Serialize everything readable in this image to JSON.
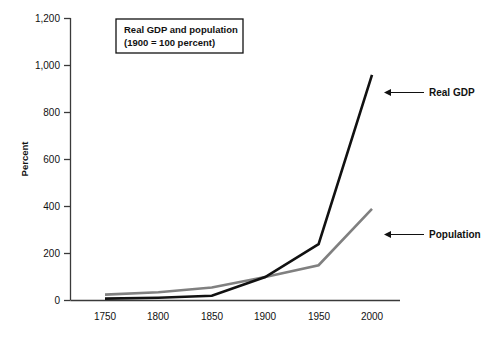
{
  "chart_data": {
    "type": "line",
    "title": "",
    "subtitle": "",
    "xlabel": "",
    "ylabel": "Percent",
    "x": [
      1750,
      1800,
      1850,
      1900,
      1950,
      2000
    ],
    "categories": [
      "1750",
      "1800",
      "1850",
      "1900",
      "1950",
      "2000"
    ],
    "xlim": [
      1725,
      2025
    ],
    "ylim": [
      0,
      1200
    ],
    "ytick_labels": [
      "0",
      "200",
      "400",
      "600",
      "800",
      "1,000",
      "1,200"
    ],
    "ytick_values": [
      0,
      200,
      400,
      600,
      800,
      1000,
      1200
    ],
    "grid": false,
    "legend_position": "none",
    "series": [
      {
        "name": "Real GDP",
        "color": "#111111",
        "width": 2.6,
        "values": [
          8,
          12,
          20,
          100,
          240,
          960
        ]
      },
      {
        "name": "Population",
        "color": "#808080",
        "width": 2.6,
        "values": [
          25,
          35,
          55,
          100,
          150,
          390
        ]
      }
    ],
    "annotations": [
      {
        "label": "Real GDP",
        "target_series": "Real GDP",
        "arrow": "left"
      },
      {
        "label": "Population",
        "target_series": "Population",
        "arrow": "left"
      }
    ],
    "legend_box": {
      "line1": "Real GDP and population",
      "line2": "(1900 = 100 percent)"
    }
  },
  "colors": {
    "real_gdp": "#111111",
    "population": "#808080",
    "axis": "#3a3a3a",
    "text": "#111111",
    "background": "#ffffff"
  }
}
